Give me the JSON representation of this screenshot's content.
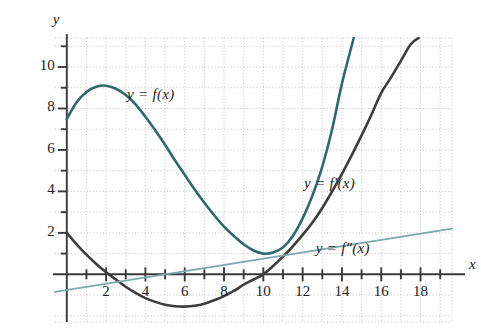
{
  "figure": {
    "background": "#ffffff",
    "axis_color": "#3a3a3a",
    "grid_color": "#b9b9b9",
    "text_color": "#1c1c1c"
  },
  "axes": {
    "x_axis_label": "x",
    "y_axis_label": "y",
    "x_ticks": [
      "2",
      "4",
      "6",
      "8",
      "10",
      "12",
      "14",
      "16",
      "18"
    ],
    "y_ticks": [
      "2",
      "4",
      "6",
      "8",
      "10"
    ]
  },
  "labels": {
    "f": "y = f(x)",
    "f_prime": "y = f′(x)",
    "f_double_prime": "y = f″(x)"
  },
  "chart_data": {
    "type": "line",
    "title": "",
    "xlabel": "x",
    "ylabel": "y",
    "xlim": [
      -0.6,
      19.6
    ],
    "ylim": [
      -2.3,
      11.4
    ],
    "grid": true,
    "grid_step_x": 1,
    "grid_step_y": 1,
    "xticks_major": [
      2,
      4,
      6,
      8,
      10,
      12,
      14,
      16,
      18
    ],
    "xticks_minor": [
      1,
      3,
      5,
      7,
      9,
      11,
      13,
      15,
      17,
      19
    ],
    "yticks_major": [
      2,
      4,
      6,
      8,
      10
    ],
    "yticks_minor": [
      1,
      3,
      5,
      7,
      9,
      11
    ],
    "legend": "inline-annotations",
    "series": [
      {
        "name": "y = f(x)",
        "color": "#2e6a6b",
        "width": 2.6,
        "label_position": {
          "x": 5.0,
          "y": 8.6
        },
        "notes": "local max ~9.1 at x=2, local min ~1.0 at x=10, exits top near x=14.6",
        "x": [
          0,
          0.5,
          1,
          1.5,
          2,
          2.5,
          3,
          3.5,
          4,
          4.5,
          5,
          5.5,
          6,
          6.5,
          7,
          7.5,
          8,
          8.5,
          9,
          9.5,
          10,
          10.5,
          11,
          11.5,
          12,
          12.5,
          13,
          13.5,
          14,
          14.6
        ],
        "y": [
          7.5,
          8.3,
          8.8,
          9.05,
          9.1,
          8.95,
          8.65,
          8.2,
          7.6,
          6.95,
          6.25,
          5.5,
          4.8,
          4.1,
          3.45,
          2.85,
          2.3,
          1.85,
          1.45,
          1.15,
          1.0,
          1.05,
          1.3,
          1.85,
          2.7,
          3.8,
          5.2,
          7.0,
          9.2,
          11.4
        ]
      },
      {
        "name": "y = f′(x)",
        "color": "#3d3d3d",
        "width": 2.6,
        "label_position": {
          "x": 14.0,
          "y": 4.3
        },
        "notes": "starts at 2 when x=0, min ~-1.55 at x=6, crosses zero at x=10, exits top near x=17.8",
        "x": [
          0,
          0.5,
          1,
          1.5,
          2,
          2.5,
          3,
          3.5,
          4,
          4.5,
          5,
          5.5,
          6,
          6.5,
          7,
          7.5,
          8,
          8.5,
          9,
          9.5,
          10,
          10.5,
          11,
          11.5,
          12,
          12.5,
          13,
          13.5,
          14,
          14.5,
          15,
          15.5,
          16,
          16.5,
          17,
          17.5,
          17.9
        ],
        "y": [
          2.0,
          1.45,
          0.95,
          0.5,
          0.1,
          -0.25,
          -0.6,
          -0.9,
          -1.15,
          -1.33,
          -1.47,
          -1.54,
          -1.56,
          -1.52,
          -1.42,
          -1.25,
          -1.05,
          -0.8,
          -0.5,
          -0.25,
          0.0,
          0.4,
          0.85,
          1.35,
          1.9,
          2.5,
          3.2,
          4.0,
          4.85,
          5.75,
          6.7,
          7.7,
          8.75,
          9.5,
          10.3,
          11.1,
          11.4
        ]
      },
      {
        "name": "y = f″(x)",
        "color": "#7aa9ab",
        "width": 1.8,
        "label_position": {
          "x": 14.6,
          "y": 1.15
        },
        "notes": "straight line, crosses x-axis near x=5.3",
        "x": [
          -0.6,
          19.6
        ],
        "y": [
          -0.85,
          2.2
        ]
      }
    ]
  }
}
